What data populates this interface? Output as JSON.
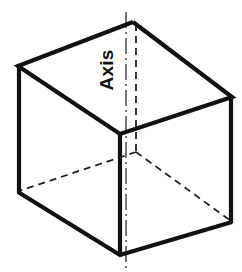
{
  "figure": {
    "name": "isometric-cube-with-vertical-axis",
    "caption_label": "Axis",
    "background_color": "#ffffff",
    "line_color": "#111111",
    "hidden_line_color": "#222222",
    "axis_line_color": "#555555",
    "label_rotation_degrees": -90,
    "view": {
      "width": 242,
      "height": 272
    },
    "geometry": {
      "vertices": {
        "top_back": [
          133,
          22
        ],
        "top_left": [
          18,
          66
        ],
        "top_front": [
          120,
          134
        ],
        "top_right": [
          232,
          97
        ],
        "bottom_left": [
          18,
          192
        ],
        "bottom_front": [
          120,
          255
        ],
        "bottom_right": [
          232,
          222
        ],
        "bottom_back_hidden": [
          136,
          152
        ]
      },
      "visible_edges": [
        [
          [
            133,
            22
          ],
          [
            18,
            66
          ]
        ],
        [
          [
            133,
            22
          ],
          [
            232,
            97
          ]
        ],
        [
          [
            18,
            66
          ],
          [
            120,
            134
          ]
        ],
        [
          [
            120,
            134
          ],
          [
            232,
            97
          ]
        ],
        [
          [
            18,
            66
          ],
          [
            18,
            192
          ]
        ],
        [
          [
            120,
            134
          ],
          [
            120,
            255
          ]
        ],
        [
          [
            232,
            97
          ],
          [
            232,
            222
          ]
        ],
        [
          [
            18,
            192
          ],
          [
            120,
            255
          ]
        ],
        [
          [
            120,
            255
          ],
          [
            232,
            222
          ]
        ]
      ],
      "hidden_edges": [
        [
          [
            136,
            22
          ],
          [
            136,
            152
          ]
        ],
        [
          [
            136,
            152
          ],
          [
            18,
            192
          ]
        ],
        [
          [
            136,
            152
          ],
          [
            232,
            222
          ]
        ]
      ],
      "axis_line": {
        "x": 126,
        "y_start": 12,
        "y_end": 268,
        "style": "dash-dot"
      }
    },
    "label_position": {
      "x": 113,
      "y": 70
    },
    "stroke_widths": {
      "visible": 4.2,
      "hidden": 1.8,
      "axis": 1.6
    }
  }
}
